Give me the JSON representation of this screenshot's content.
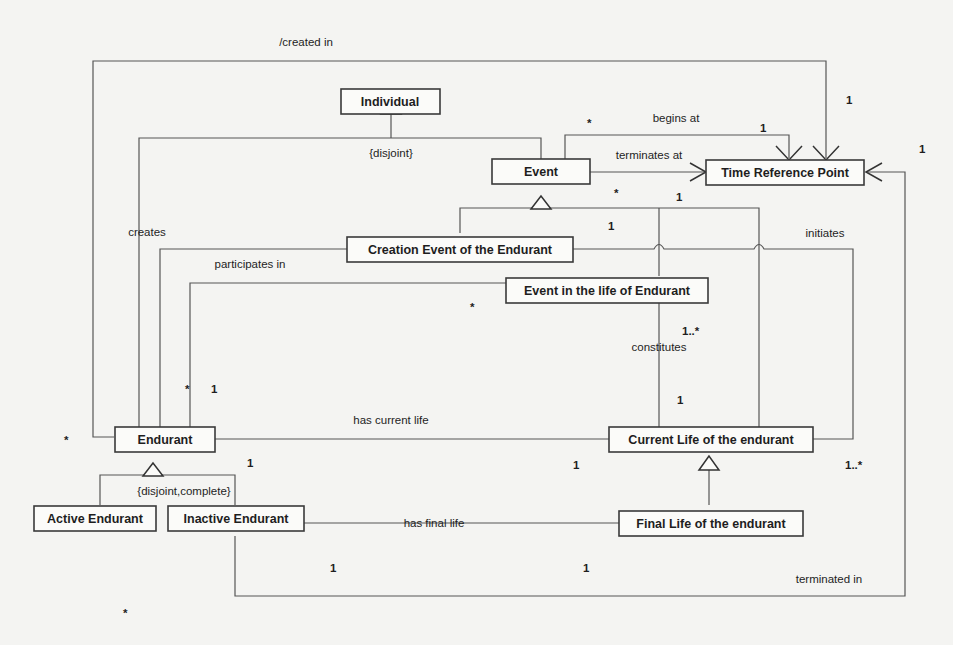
{
  "diagram": {
    "type": "UML class diagram",
    "classes": {
      "individual": "Individual",
      "event": "Event",
      "time_reference_point": "Time Reference Point",
      "creation_event": "Creation Event of the Endurant",
      "event_in_life": "Event in the life of Endurant",
      "endurant": "Endurant",
      "current_life": "Current Life of the endurant",
      "active_endurant": "Active Endurant",
      "inactive_endurant": "Inactive Endurant",
      "final_life": "Final Life of the endurant"
    },
    "constraints": {
      "individual_generalization": "{disjoint}",
      "endurant_generalization": "{disjoint,complete}"
    },
    "associations": {
      "created_in": "/created in",
      "begins_at": "begins at",
      "terminates_at": "terminates at",
      "creates": "creates",
      "participates_in": "participates in",
      "initiates": "initiates",
      "constitutes": "constitutes",
      "has_current_life": "has current life",
      "has_final_life": "has final life",
      "terminated_in": "terminated in"
    },
    "multiplicities": {
      "created_in_trp": "1",
      "begins_at_event": "*",
      "begins_at_trp": "1",
      "terminates_trp_right": "1",
      "event_star": "*",
      "event_one": "1",
      "creation_one": "1",
      "participates_star": "*",
      "constitutes_many": "1..*",
      "constitutes_one": "1",
      "endurant_participates_star": "*",
      "endurant_participates_one": "1",
      "endurant_left_star": "*",
      "has_current_life_endurant": "1",
      "has_current_life_life": "1",
      "initiates_many": "1..*",
      "has_final_life_inactive": "1",
      "has_final_life_final": "1",
      "bottom_star": "*"
    }
  }
}
